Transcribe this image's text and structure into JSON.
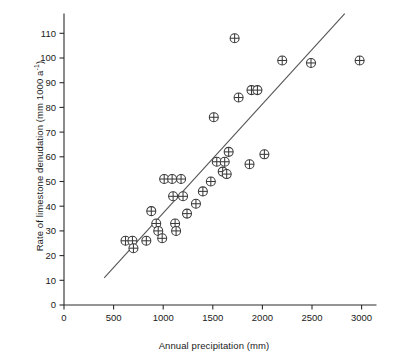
{
  "chart_data": {
    "type": "scatter",
    "title": "",
    "xlabel": "Annual precipitation (mm)",
    "ylabel_html": "Rate of limestone denudation (mm 1000 a<sup>-1</sup>)",
    "ylabel_text": "Rate of limestone denudation (mm 1000 a-1)",
    "xlim": [
      0,
      3150
    ],
    "ylim": [
      0,
      118
    ],
    "xticks": [
      0,
      500,
      1000,
      1500,
      2000,
      2500,
      3000
    ],
    "xticklabels": [
      "0",
      "500",
      "1000",
      "1500",
      "2000",
      "2500",
      "3000"
    ],
    "yticks": [
      0,
      10,
      20,
      30,
      40,
      50,
      60,
      70,
      80,
      90,
      100,
      110
    ],
    "yticklabels": [
      "0",
      "10",
      "20",
      "30",
      "40",
      "50",
      "60",
      "70",
      "80",
      "90",
      "100",
      "110"
    ],
    "grid": false,
    "legend": null,
    "marker": "circle-plus",
    "marker_size": 9,
    "marker_color": "#3a3a3a",
    "line_color": "#555555",
    "points": [
      {
        "x": 620,
        "y": 26
      },
      {
        "x": 690,
        "y": 26
      },
      {
        "x": 700,
        "y": 23
      },
      {
        "x": 830,
        "y": 26
      },
      {
        "x": 880,
        "y": 38
      },
      {
        "x": 930,
        "y": 33
      },
      {
        "x": 950,
        "y": 30
      },
      {
        "x": 990,
        "y": 27
      },
      {
        "x": 1010,
        "y": 51
      },
      {
        "x": 1090,
        "y": 51
      },
      {
        "x": 1100,
        "y": 44
      },
      {
        "x": 1120,
        "y": 33
      },
      {
        "x": 1130,
        "y": 30
      },
      {
        "x": 1180,
        "y": 51
      },
      {
        "x": 1200,
        "y": 44
      },
      {
        "x": 1240,
        "y": 37
      },
      {
        "x": 1330,
        "y": 41
      },
      {
        "x": 1400,
        "y": 46
      },
      {
        "x": 1480,
        "y": 50
      },
      {
        "x": 1510,
        "y": 76
      },
      {
        "x": 1540,
        "y": 58
      },
      {
        "x": 1600,
        "y": 54
      },
      {
        "x": 1620,
        "y": 58
      },
      {
        "x": 1640,
        "y": 53
      },
      {
        "x": 1660,
        "y": 62
      },
      {
        "x": 1720,
        "y": 108
      },
      {
        "x": 1760,
        "y": 84
      },
      {
        "x": 1870,
        "y": 57
      },
      {
        "x": 1890,
        "y": 87
      },
      {
        "x": 1950,
        "y": 87
      },
      {
        "x": 2020,
        "y": 61
      },
      {
        "x": 2200,
        "y": 99
      },
      {
        "x": 2490,
        "y": 98
      },
      {
        "x": 2980,
        "y": 99
      }
    ],
    "trendline": {
      "x1": 405,
      "y1": 11,
      "x2": 2830,
      "y2": 118
    }
  }
}
